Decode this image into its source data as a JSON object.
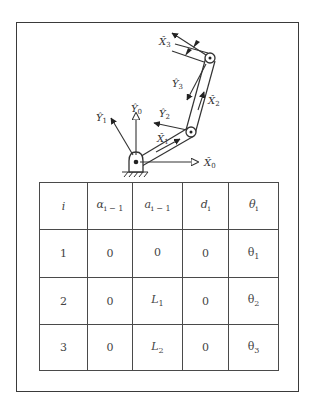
{
  "diagram": {
    "frame_labels": {
      "X0": "X̂",
      "X0_sub": "0",
      "Y0": "Ŷ",
      "Y0_sub": "0",
      "X1": "X̂",
      "X1_sub": "1",
      "Y1": "Ŷ",
      "Y1_sub": "1",
      "X2": "X̂",
      "X2_sub": "2",
      "Y2": "Ŷ",
      "Y2_sub": "2",
      "X3": "X̂",
      "X3_sub": "3",
      "Y3": "Ŷ",
      "Y3_sub": "3"
    },
    "colors": {
      "ink": "#333333",
      "frame_border": "#3a3a3a",
      "background": "#ffffff"
    }
  },
  "table": {
    "headers": [
      {
        "base": "i",
        "sub": ""
      },
      {
        "base": "α",
        "sub": "i − 1"
      },
      {
        "base": "a",
        "sub": "i − 1"
      },
      {
        "base": "d",
        "sub": "i"
      },
      {
        "base": "θ",
        "sub": "i"
      }
    ],
    "rows": [
      {
        "i": "1",
        "alpha": "0",
        "a": {
          "base": "0",
          "sub": ""
        },
        "d": "0",
        "theta": {
          "base": "θ",
          "sub": "1"
        }
      },
      {
        "i": "2",
        "alpha": "0",
        "a": {
          "base": "L",
          "sub": "1"
        },
        "d": "0",
        "theta": {
          "base": "θ",
          "sub": "2"
        }
      },
      {
        "i": "3",
        "alpha": "0",
        "a": {
          "base": "L",
          "sub": "2"
        },
        "d": "0",
        "theta": {
          "base": "θ",
          "sub": "3"
        }
      }
    ]
  },
  "caption": {
    "text": ""
  }
}
